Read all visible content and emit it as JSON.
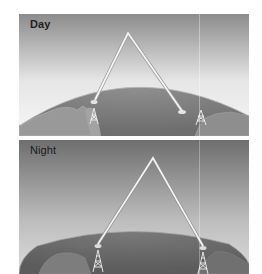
{
  "figure": {
    "panels": [
      {
        "id": "day",
        "label": "Day",
        "sky_gradient": [
          "#8a8a8a",
          "#f4f4f4"
        ],
        "earth_color": "#7d7d7d",
        "signal_path": "reflected by lower ionosphere, shorter hop"
      },
      {
        "id": "night",
        "label": "Night",
        "sky_gradient": [
          "#6f6f6f",
          "#d8d8d8"
        ],
        "earth_color": "#6a6a6a",
        "signal_path": "reflected by higher ionosphere, longer hop"
      }
    ],
    "colors": {
      "signal": "#f2f2f2",
      "signal_outline": "#9a9a9a",
      "land": "#9c9c9c",
      "tower": "#eeeeee"
    }
  }
}
